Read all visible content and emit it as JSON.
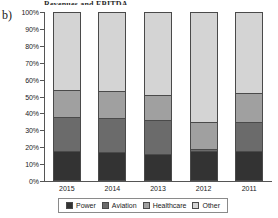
{
  "panel_letter": "b)",
  "figure_title": "Revenues and EBITDA",
  "chart_data": {
    "type": "bar",
    "subtype": "stacked-100-percent",
    "title": "",
    "xlabel": "",
    "ylabel": "",
    "categories": [
      "2015",
      "2014",
      "2013",
      "2012",
      "2011"
    ],
    "ylim": [
      0,
      100
    ],
    "ytick_labels": [
      "0%",
      "10%",
      "20%",
      "30%",
      "40%",
      "50%",
      "60%",
      "70%",
      "80%",
      "90%",
      "100%"
    ],
    "ytick_values": [
      0,
      10,
      20,
      30,
      40,
      50,
      60,
      70,
      80,
      90,
      100
    ],
    "grid": false,
    "legend_position": "bottom",
    "series": [
      {
        "name": "Power",
        "color": "#333333",
        "values": [
          18,
          17,
          16,
          18,
          18
        ]
      },
      {
        "name": "Aviation",
        "color": "#6b6b6b",
        "values": [
          20,
          20,
          20,
          1,
          17
        ]
      },
      {
        "name": "Healthcare",
        "color": "#a0a0a0",
        "values": [
          16,
          16,
          15,
          16,
          17
        ]
      },
      {
        "name": "Other",
        "color": "#d4d4d4",
        "values": [
          46,
          47,
          49,
          65,
          48
        ]
      }
    ]
  },
  "legend": {
    "items": [
      {
        "label": "Power",
        "color": "#333333"
      },
      {
        "label": "Aviation",
        "color": "#6b6b6b"
      },
      {
        "label": "Healthcare",
        "color": "#a0a0a0"
      },
      {
        "label": "Other",
        "color": "#d4d4d4"
      }
    ]
  }
}
